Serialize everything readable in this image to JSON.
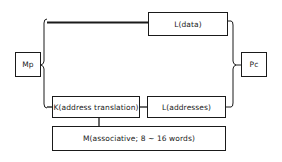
{
  "diagram": {
    "nodes": {
      "mp": {
        "label": "Mp"
      },
      "pc": {
        "label": "Pc"
      },
      "l_data": {
        "label": "L(data)"
      },
      "k_translation": {
        "label": "K(address translation)"
      },
      "l_addresses": {
        "label": "L(addresses)"
      },
      "m_associative": {
        "label": "M(associative; 8 ~ 16 words)"
      }
    },
    "edges": [
      {
        "from": "mp",
        "to": "l_data"
      },
      {
        "from": "mp",
        "to": "k_translation"
      },
      {
        "from": "k_translation",
        "to": "l_addresses"
      },
      {
        "from": "k_translation",
        "to": "m_associative"
      },
      {
        "from": "l_data",
        "to": "pc"
      },
      {
        "from": "l_addresses",
        "to": "pc"
      }
    ]
  }
}
